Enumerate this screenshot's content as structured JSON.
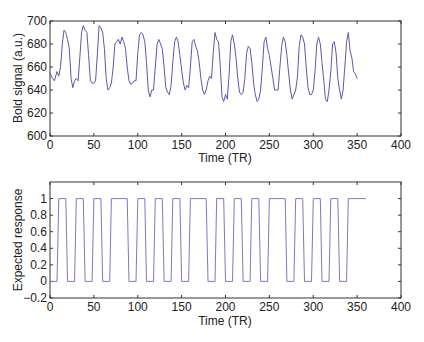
{
  "chart_data": [
    {
      "type": "line",
      "title": "",
      "xlabel": "Time (TR)",
      "ylabel": "Bold signal (a.u.)",
      "xlim": [
        0,
        400
      ],
      "ylim": [
        600,
        700
      ],
      "xticks": [
        0,
        50,
        100,
        150,
        200,
        250,
        300,
        350,
        400
      ],
      "yticks": [
        600,
        620,
        640,
        660,
        680,
        700
      ],
      "grid": false,
      "line_color": "#5a5aa8",
      "series": [
        {
          "name": "BOLD signal",
          "x": [
            0,
            3,
            5,
            8,
            10,
            12,
            14,
            16,
            18,
            20,
            22,
            24,
            26,
            28,
            30,
            32,
            34,
            36,
            38,
            40,
            42,
            44,
            46,
            48,
            50,
            52,
            54,
            56,
            58,
            60,
            62,
            64,
            66,
            68,
            70,
            72,
            74,
            76,
            78,
            80,
            82,
            84,
            86,
            88,
            90,
            92,
            94,
            96,
            98,
            100,
            102,
            104,
            106,
            108,
            110,
            112,
            114,
            116,
            118,
            120,
            122,
            124,
            126,
            128,
            130,
            132,
            134,
            136,
            138,
            140,
            142,
            144,
            146,
            148,
            150,
            152,
            154,
            156,
            158,
            160,
            162,
            164,
            166,
            168,
            170,
            172,
            174,
            176,
            178,
            180,
            182,
            184,
            186,
            188,
            190,
            192,
            194,
            196,
            198,
            200,
            202,
            204,
            206,
            208,
            210,
            212,
            214,
            216,
            218,
            220,
            222,
            224,
            226,
            228,
            230,
            232,
            234,
            236,
            238,
            240,
            242,
            244,
            246,
            248,
            250,
            252,
            254,
            256,
            258,
            260,
            262,
            264,
            266,
            268,
            270,
            272,
            274,
            276,
            278,
            280,
            282,
            284,
            286,
            288,
            290,
            292,
            294,
            296,
            298,
            300,
            302,
            304,
            306,
            308,
            310,
            312,
            314,
            316,
            318,
            320,
            322,
            324,
            326,
            328,
            330,
            332,
            334,
            336,
            338,
            340,
            342,
            344,
            346,
            348,
            350,
            352,
            354,
            356,
            358
          ],
          "values": [
            655,
            650,
            648,
            656,
            652,
            660,
            680,
            692,
            690,
            684,
            676,
            650,
            642,
            648,
            650,
            648,
            668,
            690,
            696,
            692,
            690,
            670,
            648,
            646,
            646,
            648,
            672,
            696,
            694,
            690,
            676,
            650,
            640,
            642,
            646,
            660,
            680,
            682,
            684,
            680,
            686,
            682,
            676,
            660,
            648,
            645,
            646,
            648,
            648,
            672,
            688,
            690,
            688,
            682,
            664,
            640,
            634,
            640,
            640,
            660,
            680,
            684,
            680,
            676,
            660,
            642,
            638,
            636,
            644,
            664,
            682,
            686,
            682,
            670,
            658,
            646,
            640,
            644,
            642,
            660,
            682,
            684,
            678,
            674,
            664,
            650,
            640,
            636,
            640,
            648,
            652,
            650,
            672,
            690,
            684,
            682,
            662,
            634,
            630,
            636,
            632,
            652,
            682,
            688,
            680,
            668,
            650,
            638,
            636,
            638,
            650,
            672,
            678,
            676,
            664,
            646,
            636,
            630,
            632,
            640,
            660,
            682,
            686,
            676,
            670,
            660,
            650,
            640,
            640,
            640,
            660,
            678,
            686,
            682,
            670,
            654,
            640,
            632,
            636,
            640,
            652,
            678,
            688,
            686,
            680,
            660,
            642,
            636,
            636,
            640,
            656,
            680,
            686,
            680,
            664,
            648,
            632,
            630,
            640,
            656,
            680,
            682,
            672,
            650,
            640,
            632,
            640,
            660,
            682,
            690,
            674,
            668,
            656,
            654,
            650
          ]
        }
      ]
    },
    {
      "type": "line",
      "title": "",
      "xlabel": "Time (TR)",
      "ylabel": "Expected response",
      "xlim": [
        0,
        400
      ],
      "ylim": [
        -0.2,
        1.2
      ],
      "xticks": [
        0,
        50,
        100,
        150,
        200,
        250,
        300,
        350,
        400
      ],
      "yticks": [
        -0.2,
        0,
        0.2,
        0.4,
        0.6,
        0.8,
        1
      ],
      "grid": false,
      "line_color": "#7a7ac0",
      "series": [
        {
          "name": "Boxcar design",
          "on_intervals": [
            [
              10,
              20
            ],
            [
              30,
              40
            ],
            [
              50,
              60
            ],
            [
              70,
              90
            ],
            [
              100,
              110
            ],
            [
              120,
              130
            ],
            [
              140,
              150
            ],
            [
              160,
              180
            ],
            [
              190,
              200
            ],
            [
              210,
              220
            ],
            [
              230,
              240
            ],
            [
              250,
              270
            ],
            [
              280,
              290
            ],
            [
              300,
              310
            ],
            [
              320,
              330
            ],
            [
              340,
              360
            ]
          ],
          "x": [
            0,
            8,
            10,
            18,
            20,
            28,
            30,
            38,
            40,
            48,
            50,
            58,
            60,
            68,
            70,
            88,
            90,
            98,
            100,
            108,
            110,
            118,
            120,
            128,
            130,
            138,
            140,
            148,
            150,
            158,
            160,
            178,
            180,
            188,
            190,
            198,
            200,
            208,
            210,
            218,
            220,
            228,
            230,
            238,
            240,
            248,
            250,
            268,
            270,
            278,
            280,
            288,
            290,
            298,
            300,
            308,
            310,
            318,
            320,
            328,
            330,
            338,
            340,
            360
          ],
          "values": [
            0,
            0,
            1,
            1,
            0,
            0,
            1,
            1,
            0,
            0,
            1,
            1,
            0,
            0,
            1,
            1,
            0,
            0,
            1,
            1,
            0,
            0,
            1,
            1,
            0,
            0,
            1,
            1,
            0,
            0,
            1,
            1,
            0,
            0,
            1,
            1,
            0,
            0,
            1,
            1,
            0,
            0,
            1,
            1,
            0,
            0,
            1,
            1,
            0,
            0,
            1,
            1,
            0,
            0,
            1,
            1,
            0,
            0,
            1,
            1,
            0,
            0,
            1,
            1
          ]
        }
      ]
    }
  ],
  "top": {
    "ylabel": "Bold signal (a.u.)",
    "xlabel": "Time (TR)",
    "xtick_labels": [
      "0",
      "50",
      "100",
      "150",
      "200",
      "250",
      "300",
      "350",
      "400"
    ],
    "ytick_labels": [
      "600",
      "620",
      "640",
      "660",
      "680",
      "700"
    ]
  },
  "bottom": {
    "ylabel": "Expected response",
    "xlabel": "Time (TR)",
    "xtick_labels": [
      "0",
      "50",
      "100",
      "150",
      "200",
      "250",
      "300",
      "350",
      "400"
    ],
    "ytick_labels": [
      "−0.2",
      "0",
      "0.2",
      "0.4",
      "0.6",
      "0.8",
      "1"
    ]
  }
}
